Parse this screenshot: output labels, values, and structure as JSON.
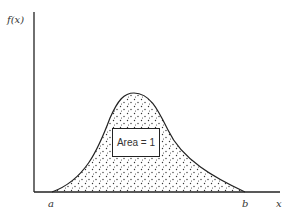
{
  "diagram": {
    "y_axis_label": "f(x)",
    "x_axis_label": "x",
    "lower_bound_label": "a",
    "upper_bound_label": "b",
    "area_label": "Area = 1"
  },
  "colors": {
    "line": "#222222",
    "fill_dots": "#333333",
    "background": "#ffffff"
  }
}
